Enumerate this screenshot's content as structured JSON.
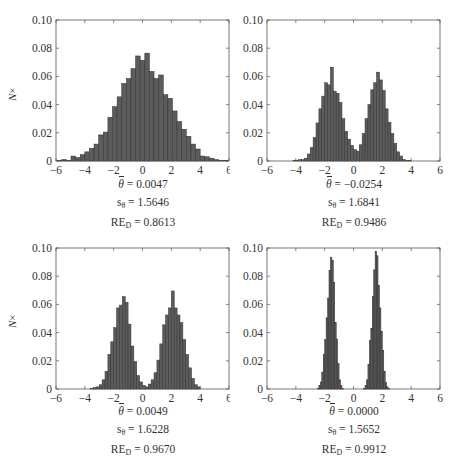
{
  "figure": {
    "y_axis_label_italic": "N",
    "y_axis_label_suffix": "×",
    "bar_color": "#5c5c5c",
    "bar_edge_color": "#2e2e2e"
  },
  "chart_data": [
    {
      "type": "bar",
      "title": "",
      "xlabel": "",
      "ylabel": "N×",
      "xlim": [
        -6,
        6
      ],
      "ylim": [
        0,
        0.1
      ],
      "xticks": [
        "−6",
        "−4",
        "−2",
        "0",
        "2",
        "4",
        "6"
      ],
      "yticks": [
        "0",
        "0.02",
        "0.04",
        "0.06",
        "0.08",
        "0.10"
      ],
      "grid": false,
      "bin_start": -5.92,
      "bin_width": 0.32,
      "values": [
        0.0005,
        0.001,
        0.0005,
        0.0035,
        0.0025,
        0.0045,
        0.0065,
        0.009,
        0.012,
        0.0185,
        0.0205,
        0.031,
        0.0385,
        0.0455,
        0.055,
        0.0585,
        0.0655,
        0.0745,
        0.0715,
        0.0765,
        0.0635,
        0.0585,
        0.061,
        0.047,
        0.0445,
        0.0355,
        0.028,
        0.0225,
        0.0175,
        0.012,
        0.0085,
        0.0035,
        0.003,
        0.002,
        0.001,
        0.0005,
        0.0005
      ],
      "stats": {
        "theta_bar": "= 0.0047",
        "s_theta": "= 1.5646",
        "re_d": "= 0.8613"
      }
    },
    {
      "type": "bar",
      "title": "",
      "xlabel": "",
      "ylabel": "",
      "xlim": [
        -6,
        6
      ],
      "ylim": [
        0,
        0.1
      ],
      "xticks": [
        "−6",
        "−4",
        "−2",
        "0",
        "2",
        "4",
        "6"
      ],
      "yticks": [
        "0",
        "0.02",
        "0.04",
        "0.06",
        "0.08",
        "0.10"
      ],
      "grid": false,
      "bin_start": -4.2,
      "bin_width": 0.2,
      "values": [
        0.0005,
        0.0005,
        0.001,
        0.001,
        0.002,
        0.005,
        0.0095,
        0.0165,
        0.027,
        0.037,
        0.046,
        0.0555,
        0.054,
        0.0665,
        0.0495,
        0.048,
        0.0415,
        0.03,
        0.021,
        0.0155,
        0.011,
        0.008,
        0.007,
        0.0115,
        0.0195,
        0.03,
        0.04,
        0.0505,
        0.0555,
        0.063,
        0.0575,
        0.05,
        0.037,
        0.0275,
        0.0195,
        0.0125,
        0.0065,
        0.0035,
        0.001,
        0.0005,
        0.0005
      ],
      "stats": {
        "theta_bar": "= −0.0254",
        "s_theta": "= 1.6841",
        "re_d": "= 0.9486"
      }
    },
    {
      "type": "bar",
      "title": "",
      "xlabel": "",
      "ylabel": "N×",
      "xlim": [
        -6,
        6
      ],
      "ylim": [
        0,
        0.1
      ],
      "xticks": [
        "−6",
        "−4",
        "−2",
        "0",
        "2",
        "4",
        "6"
      ],
      "yticks": [
        "0",
        "0.02",
        "0.04",
        "0.06",
        "0.08",
        "0.10"
      ],
      "grid": false,
      "bin_start": -3.6,
      "bin_width": 0.2,
      "values": [
        0.0005,
        0.001,
        0.0015,
        0.003,
        0.0065,
        0.0125,
        0.0245,
        0.0335,
        0.0435,
        0.0575,
        0.0595,
        0.0655,
        0.0615,
        0.046,
        0.0305,
        0.0195,
        0.0095,
        0.005,
        0.0025,
        0.0015,
        0.0035,
        0.0065,
        0.0115,
        0.0205,
        0.032,
        0.0455,
        0.0525,
        0.0575,
        0.0695,
        0.0575,
        0.0525,
        0.047,
        0.035,
        0.0245,
        0.015,
        0.0075,
        0.003,
        0.0015
      ],
      "stats": {
        "theta_bar": "= 0.0049",
        "s_theta": "= 1.6228",
        "re_d": "= 0.9670"
      }
    },
    {
      "type": "bar",
      "title": "",
      "xlabel": "",
      "ylabel": "",
      "xlim": [
        -6,
        6
      ],
      "ylim": [
        0,
        0.1
      ],
      "xticks": [
        "−6",
        "−4",
        "−2",
        "0",
        "2",
        "4",
        "6"
      ],
      "yticks": [
        "0",
        "0.02",
        "0.04",
        "0.06",
        "0.08",
        "0.10"
      ],
      "grid": false,
      "bin_start": -2.5,
      "bin_width": 0.1,
      "values": [
        0.0005,
        0.0025,
        0.005,
        0.012,
        0.0245,
        0.035,
        0.0505,
        0.0645,
        0.084,
        0.0935,
        0.091,
        0.0755,
        0.047,
        0.0355,
        0.018,
        0.0065,
        0.0025,
        0.0005,
        0.0,
        0.0,
        0.0,
        0.0,
        0.0,
        0.0,
        0.0,
        0.0,
        0.0,
        0.0,
        0.0,
        0.0,
        0.0,
        0.0,
        0.0005,
        0.0025,
        0.0065,
        0.0175,
        0.0345,
        0.043,
        0.0655,
        0.0845,
        0.0975,
        0.0945,
        0.0735,
        0.0575,
        0.041,
        0.0275,
        0.0125,
        0.0045,
        0.0015,
        0.0005
      ],
      "stats": {
        "theta_bar": "= 0.0000",
        "s_theta": "= 1.5652",
        "re_d": "= 0.9912"
      }
    }
  ]
}
